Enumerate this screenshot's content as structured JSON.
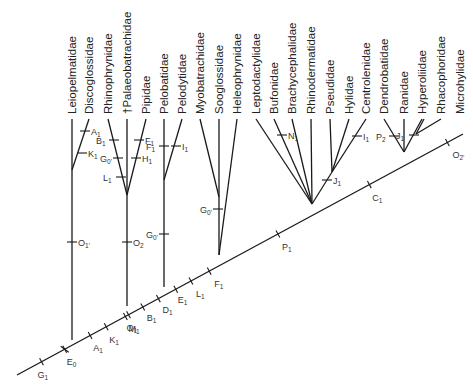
{
  "taxa": [
    "Leiopelmatidae",
    "Discoglossidae",
    "Rhinophrynidae",
    "†Palaeobatrachidae",
    "Pipidae",
    "Pelobatidae",
    "Pelodytidae",
    "Myobatrachidae",
    "Sooglossidae",
    "Heleophrynidae",
    "Leptodactylidae",
    "Bufonidae",
    "Brachycephalidae",
    "Rhinodermatidae",
    "Pseudidae",
    "Hylidae",
    "Centrolenidae",
    "Dendrobatidae",
    "Ranidae",
    "Hyperoliidae",
    "Rhacophoridae",
    "Microhylidae"
  ],
  "spine_characters": [
    {
      "letter": "G",
      "sub": "1"
    },
    {
      "letter": "E",
      "sub": "0"
    },
    {
      "letter": "A",
      "sub": "1"
    },
    {
      "letter": "K",
      "sub": "1"
    },
    {
      "letter": "M",
      "sub": "1"
    },
    {
      "letter": "O",
      "sub": "1"
    },
    {
      "letter": "B",
      "sub": "1"
    },
    {
      "letter": "D",
      "sub": "1"
    },
    {
      "letter": "E",
      "sub": "1"
    },
    {
      "letter": "L",
      "sub": "1"
    },
    {
      "letter": "F",
      "sub": "1"
    },
    {
      "letter": "P",
      "sub": "1"
    },
    {
      "letter": "C",
      "sub": "1"
    },
    {
      "letter": "O",
      "sub": "2'"
    }
  ],
  "branch_characters": [
    {
      "letter": "A",
      "sub": "1",
      "branch": "Discoglossidae"
    },
    {
      "letter": "K",
      "sub": "1",
      "branch": "Discoglossidae"
    },
    {
      "letter": "O",
      "sub": "1'",
      "branch": "Leiopelmatidae+Discoglossidae"
    },
    {
      "letter": "B",
      "sub": "1",
      "branch": "Rhinophrynidae"
    },
    {
      "letter": "G",
      "sub": "0'",
      "branch": "Rhinophrynidae"
    },
    {
      "letter": "L",
      "sub": "1",
      "branch": "Rhinophrynidae"
    },
    {
      "letter": "F",
      "sub": "1",
      "branch": "Pipidae"
    },
    {
      "letter": "H",
      "sub": "1",
      "branch": "Pipidae"
    },
    {
      "letter": "O",
      "sub": "2",
      "branch": "Pipoidea"
    },
    {
      "letter": "F",
      "sub": "1",
      "branch": "Pelobatidae"
    },
    {
      "letter": "I",
      "sub": "1",
      "branch": "Pelodytidae"
    },
    {
      "letter": "G",
      "sub": "0'",
      "branch": "Pelobatoidea"
    },
    {
      "letter": "G",
      "sub": "0'",
      "branch": "Myobatrachidae+Sooglossidae"
    },
    {
      "letter": "N",
      "sub": "1",
      "branch": "Bufonidae"
    },
    {
      "letter": "J",
      "sub": "1",
      "branch": "Pseudidae+Hylidae+Centrolenidae"
    },
    {
      "letter": "I",
      "sub": "1",
      "branch": "Centrolenidae"
    },
    {
      "letter": "P",
      "sub": "2",
      "branch": "Dendrobatidae"
    },
    {
      "letter": "J",
      "sub": "1",
      "branch": "Hyperoliidae+Rhacophoridae"
    }
  ]
}
